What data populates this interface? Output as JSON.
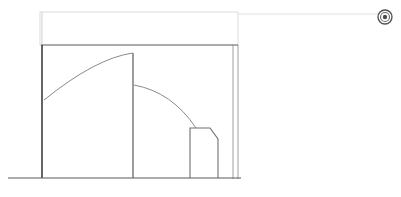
{
  "document": {
    "title": "CAD Elevation Drawing",
    "background_color": "#ffffff",
    "width": 401,
    "height": 197
  },
  "palette": {
    "line_dark": "#4a4a4a",
    "line_medium": "#777777",
    "line_light": "#b8b8b8",
    "line_faint": "#d8d8d8",
    "line_very_faint": "#e8e8e8",
    "marker_color": "#555555",
    "background": "#ffffff"
  },
  "geometry": {
    "ground_line": {
      "label": "ground-line",
      "x1": 8,
      "y1": 178,
      "x2": 241,
      "y2": 178,
      "color": "#5a5a5a",
      "width": 1.2
    },
    "upper_guide_box": {
      "label": "upper-guide-rectangle",
      "x": 40,
      "y": 12,
      "width": 198,
      "height": 33,
      "color": "#dcdcdc",
      "stroke_width": 1
    },
    "extension_line": {
      "label": "horizontal-extension-line",
      "x1": 238,
      "y1": 14,
      "x2": 378,
      "y2": 14,
      "color": "#e2e2e2",
      "width": 1
    },
    "main_outline": {
      "label": "main-body-outline",
      "top_y": 45,
      "bottom_y": 178,
      "left_x": 41,
      "right_x": 233,
      "color": "#6a6a6a",
      "stroke_width": 1.1
    },
    "right_double_line": {
      "label": "right-edge-double-line",
      "inner_x": 233,
      "outer_x": 238,
      "top_y": 45,
      "bottom_y": 179,
      "color": "#a0a0a0",
      "stroke_width": 1
    },
    "left_wall": {
      "label": "left-wall-line",
      "x": 42,
      "top_y": 45,
      "bottom_y": 178,
      "color": "#3f3f3f",
      "stroke_width": 1.6
    },
    "left_wall_upper_tick": {
      "label": "left-wall-upper-tick",
      "x": 42,
      "top_y": 12,
      "bottom_y": 45,
      "color": "#cfcfcf",
      "stroke_width": 1
    },
    "middle_wall": {
      "label": "middle-partition-line",
      "x": 133,
      "top_y": 53,
      "bottom_y": 178,
      "color": "#5c5c5c",
      "stroke_width": 1.2
    },
    "arc_large": {
      "label": "large-swing-arc",
      "start_x": 44,
      "start_y": 100,
      "end_x": 133,
      "end_y": 53,
      "control_x": 96,
      "control_y": 58,
      "color": "#8a8a8a",
      "stroke_width": 1
    },
    "arc_small": {
      "label": "small-swing-arc",
      "start_x": 134,
      "start_y": 85,
      "end_x": 196,
      "end_y": 128,
      "control_x": 172,
      "control_y": 92,
      "color": "#8a8a8a",
      "stroke_width": 1
    },
    "inner_box": {
      "label": "chamfered-inner-box",
      "left_x": 190,
      "right_x": 218,
      "top_y": 128,
      "bottom_y": 178,
      "chamfer_x": 210,
      "chamfer_y": 139,
      "color": "#6f6f6f",
      "stroke_width": 1.1
    },
    "segment_top_left": {
      "label": "top-edge-left-segment",
      "x1": 41,
      "y1": 45,
      "x2": 133,
      "y2": 45
    },
    "segment_top_right": {
      "label": "top-edge-right-segment",
      "x1": 133,
      "y1": 45,
      "x2": 233,
      "y2": 45
    }
  },
  "marker": {
    "label": "registration-target-marker",
    "icon": "target-icon",
    "center_x": 385,
    "center_y": 17,
    "outer_radius": 7,
    "mid_radius": 4.5,
    "inner_radius": 2.2,
    "color": "#4d4d4d"
  },
  "status": {
    "visible_text": ""
  }
}
